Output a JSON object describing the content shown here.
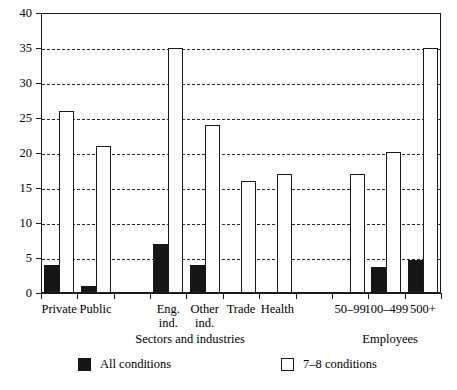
{
  "chart_data": {
    "type": "bar",
    "title": "",
    "subtitle": "",
    "xlabel": "",
    "ylabel": "",
    "ylim": [
      0,
      40
    ],
    "yticks": [
      0,
      5,
      10,
      15,
      20,
      25,
      30,
      35,
      40
    ],
    "grid": "horizontal-dashed",
    "legend_position": "bottom",
    "categories": [
      "Private",
      "Public",
      "",
      "Eng. ind.",
      "Other ind.",
      "Trade",
      "Health",
      "",
      "50–99",
      "100–499",
      "500+"
    ],
    "category_labels": [
      {
        "line1": "Private",
        "line2": ""
      },
      {
        "line1": "Public",
        "line2": ""
      },
      {
        "line1": "",
        "line2": ""
      },
      {
        "line1": "Eng.",
        "line2": "ind."
      },
      {
        "line1": "Other",
        "line2": "ind."
      },
      {
        "line1": "Trade",
        "line2": ""
      },
      {
        "line1": "Health",
        "line2": ""
      },
      {
        "line1": "",
        "line2": ""
      },
      {
        "line1": "50–99",
        "line2": ""
      },
      {
        "line1": "100–499",
        "line2": ""
      },
      {
        "line1": "500+",
        "line2": ""
      }
    ],
    "series": [
      {
        "name": "All conditions",
        "color": "#161616",
        "values": [
          4,
          1,
          null,
          7,
          4,
          null,
          null,
          null,
          null,
          3.7,
          4.7
        ]
      },
      {
        "name": "7–8 conditions",
        "color": "#ffffff",
        "values": [
          26,
          21,
          null,
          35,
          24,
          16,
          17,
          null,
          17,
          20.1,
          35
        ]
      }
    ],
    "group_titles": [
      {
        "text": "Sectors and industries",
        "at_category": 3.6
      },
      {
        "text": "Employees",
        "at_category": 9.1
      }
    ],
    "legend": [
      {
        "label": "All conditions",
        "swatch": "dark"
      },
      {
        "label": "7–8 conditions",
        "swatch": "light"
      }
    ]
  }
}
